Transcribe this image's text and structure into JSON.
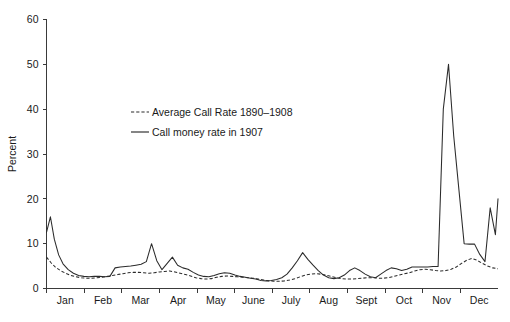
{
  "chart_data": {
    "type": "line",
    "title": "",
    "subtitle": "",
    "xlabel": "",
    "ylabel": "Percent",
    "ylim": [
      0,
      60
    ],
    "yticks": [
      0,
      10,
      20,
      30,
      40,
      50,
      60
    ],
    "ytick_labels": [
      "0",
      "10",
      "20",
      "30",
      "40",
      "50",
      "60"
    ],
    "grid": false,
    "legend_position": "upper-left-inside",
    "x_axis_type": "month-of-year",
    "categories": [
      "Jan",
      "Feb",
      "Mar",
      "Apr",
      "May",
      "June",
      "July",
      "Aug",
      "Sept",
      "Oct",
      "Nov",
      "Dec"
    ],
    "xtick_labels": [
      "Jan",
      "Feb",
      "Mar",
      "Apr",
      "May",
      "June",
      "July",
      "Aug",
      "Sept",
      "Oct",
      "Nov",
      "Dec"
    ],
    "x_units": "weekly observations across 1907",
    "series": [
      {
        "name": "Average Call Rate 1890–1908",
        "style": "dashed",
        "color": "#2b2b2b",
        "x": [
          0.0,
          0.5,
          1.0,
          1.6,
          2.2,
          2.8,
          3.4,
          4.0,
          4.6,
          5.2,
          5.8,
          6.4,
          7.0,
          7.6,
          8.2,
          8.8,
          9.4,
          10.0,
          10.6,
          11.2,
          11.8,
          12.4,
          13.0,
          13.6,
          14.2,
          14.8,
          15.4,
          16.0,
          16.6,
          17.2,
          17.8,
          18.4,
          19.0,
          19.6,
          20.2,
          20.8,
          21.4,
          22.0,
          22.6,
          23.2,
          23.8,
          24.4,
          25.0,
          25.6,
          26.2,
          26.8,
          27.4,
          28.0,
          28.6,
          29.2,
          29.8,
          30.4,
          31.0,
          31.6,
          32.2,
          32.8,
          33.4,
          34.0,
          34.6,
          35.2,
          35.8,
          36.4,
          37.0,
          37.6,
          38.2,
          38.8,
          39.4,
          40.0,
          40.6,
          41.2,
          41.8,
          42.4,
          43.0,
          43.6,
          44.2,
          44.8,
          45.4,
          46.0,
          46.6,
          47.2,
          47.8,
          48.4,
          49.0,
          49.6,
          50.2,
          50.8,
          51.4,
          52.0
        ],
        "values": [
          7.0,
          5.8,
          4.8,
          4.0,
          3.4,
          2.9,
          2.6,
          2.4,
          2.3,
          2.3,
          2.4,
          2.5,
          2.7,
          2.9,
          3.1,
          3.3,
          3.5,
          3.6,
          3.6,
          3.5,
          3.4,
          3.5,
          3.7,
          3.8,
          3.9,
          3.7,
          3.4,
          3.1,
          2.8,
          2.4,
          2.2,
          2.1,
          2.2,
          2.5,
          2.7,
          2.8,
          2.7,
          2.6,
          2.5,
          2.4,
          2.3,
          2.1,
          1.9,
          1.7,
          1.6,
          1.6,
          1.7,
          1.9,
          2.2,
          2.6,
          3.0,
          3.2,
          3.3,
          3.2,
          3.0,
          2.7,
          2.4,
          2.2,
          2.1,
          2.1,
          2.2,
          2.3,
          2.4,
          2.4,
          2.3,
          2.3,
          2.4,
          2.7,
          3.0,
          3.3,
          3.5,
          3.9,
          4.2,
          4.3,
          4.2,
          4.0,
          3.9,
          4.0,
          4.3,
          4.8,
          5.6,
          6.3,
          6.7,
          6.3,
          5.6,
          5.0,
          4.6,
          4.4
        ]
      },
      {
        "name": "Call money rate in 1907",
        "style": "solid",
        "color": "#2b2b2b",
        "x": [
          0.0,
          0.45,
          0.9,
          1.4,
          1.9,
          2.5,
          3.1,
          3.7,
          4.3,
          4.9,
          5.5,
          6.1,
          6.7,
          7.3,
          7.9,
          8.5,
          9.1,
          9.7,
          10.3,
          10.9,
          11.5,
          12.1,
          12.7,
          13.3,
          13.9,
          14.5,
          15.1,
          15.7,
          16.3,
          16.9,
          17.5,
          18.1,
          18.7,
          19.3,
          19.9,
          20.5,
          21.1,
          21.7,
          22.3,
          22.9,
          23.5,
          24.1,
          24.7,
          25.3,
          25.9,
          26.5,
          27.1,
          27.7,
          28.3,
          28.9,
          29.5,
          30.1,
          30.7,
          31.3,
          31.9,
          32.5,
          33.1,
          33.7,
          34.3,
          34.9,
          35.5,
          36.1,
          36.7,
          37.3,
          37.9,
          38.5,
          39.1,
          39.7,
          40.3,
          40.9,
          41.5,
          42.1,
          42.7,
          43.3,
          43.9,
          44.5,
          45.1,
          45.7,
          46.3,
          46.9,
          47.5,
          48.1,
          48.7,
          49.3,
          49.9,
          50.5,
          51.1,
          51.7,
          52.0
        ],
        "values": [
          12.5,
          16.0,
          11.0,
          7.5,
          5.5,
          4.2,
          3.4,
          2.9,
          2.7,
          2.6,
          2.7,
          2.7,
          2.6,
          2.7,
          4.6,
          4.8,
          4.9,
          5.0,
          5.2,
          5.4,
          6.0,
          10.0,
          6.2,
          4.2,
          5.6,
          7.0,
          5.2,
          4.6,
          4.3,
          3.6,
          3.0,
          2.7,
          2.6,
          2.9,
          3.3,
          3.5,
          3.4,
          3.0,
          2.7,
          2.5,
          2.3,
          2.1,
          1.8,
          1.7,
          1.8,
          2.0,
          2.4,
          3.2,
          4.6,
          6.2,
          8.0,
          6.5,
          5.2,
          4.0,
          3.0,
          2.4,
          2.2,
          2.4,
          3.0,
          4.0,
          4.6,
          4.0,
          3.2,
          2.6,
          2.4,
          3.2,
          4.0,
          4.6,
          4.4,
          4.0,
          4.3,
          4.8,
          4.8,
          4.8,
          4.8,
          4.9,
          4.9,
          40.0,
          50.0,
          34.0,
          22.0,
          10.0,
          9.9,
          9.9,
          7.6,
          6.0,
          18.0,
          12.0,
          20.0
        ]
      }
    ],
    "annotations": [
      {
        "label": "January opening spike",
        "x": "Jan",
        "value": 16
      },
      {
        "label": "March spike",
        "x": "Mar",
        "value": 10
      },
      {
        "label": "July spike",
        "x": "July",
        "value": 8
      },
      {
        "label": "Panic of 1907 peak",
        "x": "Nov",
        "value": 50
      },
      {
        "label": "Year-end rise",
        "x": "Dec",
        "value": 20
      }
    ]
  },
  "legend": {
    "entries": [
      {
        "label": "Average Call Rate 1890–1908",
        "style": "dashed"
      },
      {
        "label": "Call money rate in 1907",
        "style": "solid"
      }
    ]
  },
  "colors": {
    "line": "#2b2b2b",
    "axis": "#3a3a3a",
    "text": "#1a1a1a",
    "background": "#ffffff"
  }
}
